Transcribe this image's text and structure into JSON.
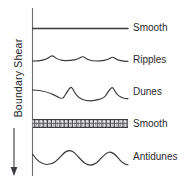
{
  "figure": {
    "axis": {
      "title": "Boundary Shear",
      "arrow_direction": "down",
      "arrow_meaning": "increasing",
      "axis_line_color": "#6b6b70"
    },
    "colors": {
      "line": "#3a3a3f",
      "text": "#2a2a2e",
      "background": "#ffffff"
    },
    "bedforms": [
      {
        "label": "Smooth",
        "profile": "flat",
        "description": "plane bed, lower flow regime",
        "y": 28
      },
      {
        "label": "Ripples",
        "profile": "small-asymmetric-waves",
        "description": "low amplitude asymmetric ripples",
        "y": 60
      },
      {
        "label": "Dunes",
        "profile": "large-asymmetric-waves",
        "description": "large asymmetric dunes with steep lee slopes",
        "y": 92
      },
      {
        "label": "Smooth",
        "profile": "hatched-plane-bed",
        "description": "plane bed with parting lineation, upper flow regime",
        "y": 124
      },
      {
        "label": "Antidunes",
        "profile": "symmetric-sinusoidal-waves",
        "description": "symmetric in-phase antidune waves",
        "y": 157
      }
    ]
  }
}
